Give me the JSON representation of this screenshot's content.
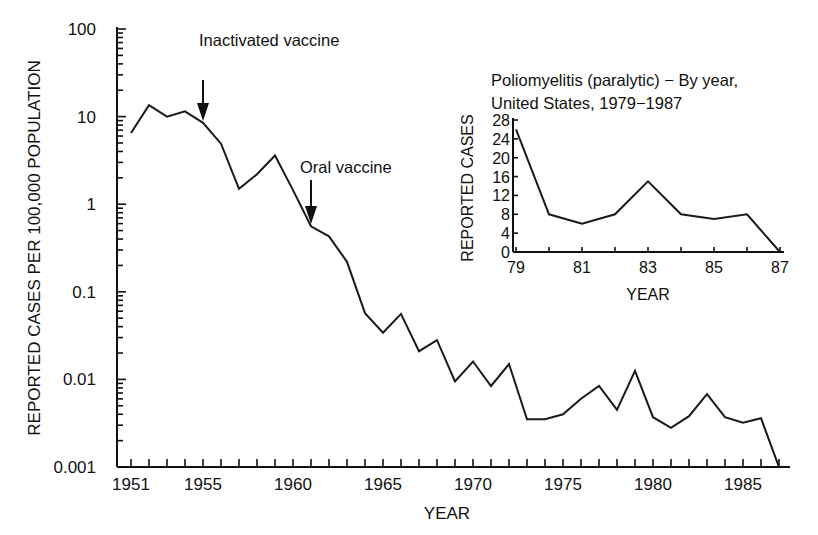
{
  "chart_data": [
    {
      "type": "line",
      "title": "",
      "xlabel": "YEAR",
      "ylabel": "REPORTED CASES PER 100,000 POPULATION",
      "yscale": "log",
      "ylim": [
        0.001,
        100
      ],
      "xlim": [
        1950.2,
        1988
      ],
      "grid": false,
      "ytick_labels": [
        "100",
        "10",
        "1",
        "0.1",
        "0.01",
        "0.001"
      ],
      "ytick_values": [
        100,
        10,
        1,
        0.1,
        0.01,
        0.001
      ],
      "xtick_labels": [
        "1951",
        "1955",
        "1960",
        "1965",
        "1970",
        "1975",
        "1980",
        "1985"
      ],
      "xtick_values": [
        1951,
        1955,
        1960,
        1965,
        1970,
        1975,
        1980,
        1985
      ],
      "x": [
        1951,
        1952,
        1953,
        1954,
        1955,
        1956,
        1957,
        1958,
        1959,
        1960,
        1961,
        1962,
        1963,
        1964,
        1965,
        1966,
        1967,
        1968,
        1969,
        1970,
        1971,
        1972,
        1973,
        1974,
        1975,
        1976,
        1977,
        1978,
        1979,
        1980,
        1981,
        1982,
        1983,
        1984,
        1985,
        1986,
        1987
      ],
      "series": [
        {
          "name": "Poliomyelitis (paralytic) rate",
          "values": [
            6.5,
            13.5,
            10,
            11.5,
            8.5,
            4.9,
            1.5,
            2.2,
            3.6,
            1.45,
            0.56,
            0.43,
            0.22,
            0.057,
            0.034,
            0.056,
            0.021,
            0.028,
            0.0095,
            0.016,
            0.0084,
            0.015,
            0.0035,
            0.0035,
            0.004,
            0.006,
            0.0084,
            0.0045,
            0.0125,
            0.0037,
            0.0028,
            0.0038,
            0.0068,
            0.0037,
            0.0032,
            0.0036,
            0.001
          ]
        }
      ],
      "annotations": [
        {
          "text": "Inactivated vaccine",
          "x": 1955,
          "arrow": true
        },
        {
          "text": "Oral vaccine",
          "x": 1961,
          "arrow": true
        }
      ]
    },
    {
      "type": "line",
      "title": "Poliomyelitis (paralytic) — By year, United States, 1979–1987",
      "title_lines": [
        "Poliomyelitis (paralytic) − By year,",
        "United States, 1979−1987"
      ],
      "xlabel": "YEAR",
      "ylabel": "REPORTED CASES",
      "ylim": [
        0,
        28
      ],
      "xlim": [
        1979,
        1987
      ],
      "grid": false,
      "ytick_labels": [
        "0",
        "4",
        "8",
        "12",
        "16",
        "20",
        "24",
        "28"
      ],
      "ytick_values": [
        0,
        4,
        8,
        12,
        16,
        20,
        24,
        28
      ],
      "xtick_labels": [
        "79",
        "81",
        "83",
        "85",
        "87"
      ],
      "xtick_values": [
        79,
        81,
        83,
        85,
        87
      ],
      "x": [
        79,
        80,
        81,
        82,
        83,
        84,
        85,
        86,
        87
      ],
      "series": [
        {
          "name": "Reported cases",
          "values": [
            26,
            8,
            6,
            8,
            15,
            8,
            7,
            8,
            0
          ]
        }
      ]
    }
  ]
}
